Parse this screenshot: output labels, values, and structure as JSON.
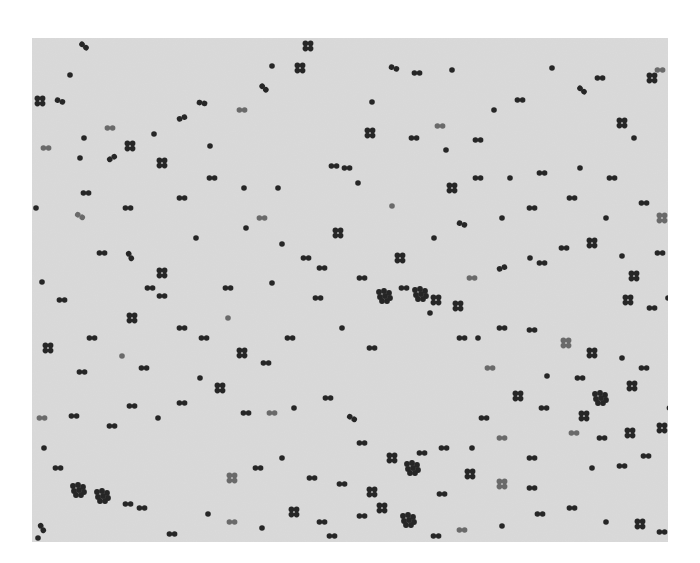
{
  "image": {
    "subject": "micrograph of spherical bacteria (cocci) in pairs, tetrads and small clusters",
    "frame": {
      "x": 32,
      "y": 38,
      "width": 636,
      "height": 504
    },
    "colors": {
      "page": "#ffffff",
      "field": "#dadada",
      "cell": "#262626",
      "cell_faint": "#6a6a6a"
    },
    "cells": [
      [
        52,
        8,
        "d",
        40
      ],
      [
        38,
        37,
        "s",
        0
      ],
      [
        8,
        63,
        "t",
        0
      ],
      [
        28,
        63,
        "d",
        20
      ],
      [
        78,
        90,
        "d",
        0
      ],
      [
        52,
        100,
        "s",
        0
      ],
      [
        54,
        155,
        "d",
        0
      ],
      [
        80,
        120,
        "d",
        -30
      ],
      [
        98,
        108,
        "t",
        0
      ],
      [
        122,
        96,
        "s",
        0
      ],
      [
        150,
        80,
        "d",
        -20
      ],
      [
        170,
        65,
        "d",
        10
      ],
      [
        178,
        108,
        "s",
        0
      ],
      [
        210,
        72,
        "d",
        0
      ],
      [
        232,
        50,
        "d",
        45
      ],
      [
        268,
        30,
        "t",
        0
      ],
      [
        276,
        8,
        "t",
        0
      ],
      [
        240,
        28,
        "s",
        0
      ],
      [
        130,
        125,
        "t",
        0
      ],
      [
        180,
        140,
        "d",
        0
      ],
      [
        212,
        150,
        "s",
        0
      ],
      [
        96,
        170,
        "d",
        0
      ],
      [
        48,
        178,
        "d",
        30
      ],
      [
        4,
        170,
        "s",
        0
      ],
      [
        150,
        160,
        "d",
        0
      ],
      [
        98,
        218,
        "d",
        60
      ],
      [
        130,
        235,
        "t",
        0
      ],
      [
        164,
        200,
        "s",
        0
      ],
      [
        118,
        250,
        "d",
        0
      ],
      [
        70,
        215,
        "d",
        0
      ],
      [
        214,
        190,
        "s",
        0
      ],
      [
        230,
        180,
        "d",
        0
      ],
      [
        246,
        150,
        "s",
        0
      ],
      [
        302,
        128,
        "d",
        0
      ],
      [
        315,
        130,
        "d",
        0
      ],
      [
        338,
        95,
        "t",
        0
      ],
      [
        340,
        64,
        "s",
        0
      ],
      [
        362,
        30,
        "d",
        20
      ],
      [
        385,
        35,
        "d",
        0
      ],
      [
        420,
        32,
        "s",
        0
      ],
      [
        408,
        88,
        "d",
        0
      ],
      [
        446,
        102,
        "d",
        0
      ],
      [
        462,
        72,
        "s",
        0
      ],
      [
        488,
        62,
        "d",
        0
      ],
      [
        520,
        30,
        "s",
        0
      ],
      [
        550,
        52,
        "d",
        40
      ],
      [
        568,
        40,
        "d",
        0
      ],
      [
        590,
        85,
        "t",
        0
      ],
      [
        620,
        40,
        "t",
        0
      ],
      [
        628,
        32,
        "d",
        0
      ],
      [
        602,
        100,
        "s",
        0
      ],
      [
        580,
        140,
        "d",
        0
      ],
      [
        548,
        130,
        "s",
        0
      ],
      [
        510,
        135,
        "d",
        0
      ],
      [
        478,
        140,
        "s",
        0
      ],
      [
        446,
        140,
        "d",
        0
      ],
      [
        414,
        112,
        "s",
        0
      ],
      [
        382,
        100,
        "d",
        0
      ],
      [
        360,
        168,
        "s",
        0
      ],
      [
        326,
        145,
        "s",
        0
      ],
      [
        420,
        150,
        "t",
        0
      ],
      [
        430,
        186,
        "d",
        20
      ],
      [
        402,
        200,
        "s",
        0
      ],
      [
        368,
        220,
        "t",
        0
      ],
      [
        388,
        256,
        "X",
        0
      ],
      [
        404,
        262,
        "t",
        0
      ],
      [
        426,
        268,
        "t",
        0
      ],
      [
        440,
        240,
        "d",
        0
      ],
      [
        470,
        230,
        "d",
        -20
      ],
      [
        498,
        220,
        "s",
        0
      ],
      [
        510,
        225,
        "d",
        0
      ],
      [
        532,
        210,
        "d",
        0
      ],
      [
        560,
        205,
        "t",
        0
      ],
      [
        590,
        218,
        "s",
        0
      ],
      [
        602,
        238,
        "t",
        0
      ],
      [
        628,
        215,
        "d",
        0
      ],
      [
        630,
        180,
        "t",
        0
      ],
      [
        612,
        165,
        "d",
        0
      ],
      [
        352,
        258,
        "X",
        0
      ],
      [
        372,
        250,
        "d",
        0
      ],
      [
        398,
        275,
        "s",
        0
      ],
      [
        430,
        300,
        "d",
        0
      ],
      [
        446,
        300,
        "s",
        0
      ],
      [
        470,
        290,
        "d",
        0
      ],
      [
        500,
        292,
        "d",
        0
      ],
      [
        534,
        305,
        "t",
        0
      ],
      [
        560,
        315,
        "t",
        0
      ],
      [
        590,
        320,
        "s",
        0
      ],
      [
        612,
        330,
        "d",
        0
      ],
      [
        600,
        348,
        "t",
        0
      ],
      [
        548,
        340,
        "d",
        0
      ],
      [
        515,
        338,
        "s",
        0
      ],
      [
        568,
        360,
        "X",
        0
      ],
      [
        552,
        378,
        "t",
        0
      ],
      [
        542,
        395,
        "d",
        0
      ],
      [
        570,
        400,
        "d",
        0
      ],
      [
        598,
        395,
        "t",
        0
      ],
      [
        630,
        390,
        "t",
        0
      ],
      [
        640,
        370,
        "d",
        0
      ],
      [
        614,
        418,
        "d",
        0
      ],
      [
        590,
        428,
        "d",
        0
      ],
      [
        560,
        430,
        "s",
        0
      ],
      [
        500,
        420,
        "d",
        0
      ],
      [
        470,
        400,
        "d",
        0
      ],
      [
        440,
        410,
        "s",
        0
      ],
      [
        412,
        410,
        "d",
        0
      ],
      [
        390,
        415,
        "d",
        0
      ],
      [
        360,
        420,
        "t",
        0
      ],
      [
        330,
        405,
        "d",
        0
      ],
      [
        320,
        380,
        "d",
        30
      ],
      [
        296,
        360,
        "d",
        0
      ],
      [
        262,
        370,
        "s",
        0
      ],
      [
        240,
        375,
        "d",
        0
      ],
      [
        214,
        375,
        "d",
        0
      ],
      [
        188,
        350,
        "t",
        0
      ],
      [
        168,
        340,
        "s",
        0
      ],
      [
        150,
        365,
        "d",
        0
      ],
      [
        126,
        380,
        "s",
        0
      ],
      [
        100,
        368,
        "d",
        0
      ],
      [
        80,
        388,
        "d",
        0
      ],
      [
        42,
        378,
        "d",
        0
      ],
      [
        10,
        380,
        "d",
        0
      ],
      [
        12,
        410,
        "s",
        0
      ],
      [
        26,
        430,
        "d",
        0
      ],
      [
        46,
        452,
        "X",
        0
      ],
      [
        70,
        458,
        "X",
        0
      ],
      [
        96,
        466,
        "d",
        0
      ],
      [
        110,
        470,
        "d",
        0
      ],
      [
        140,
        496,
        "d",
        0
      ],
      [
        176,
        476,
        "s",
        0
      ],
      [
        200,
        484,
        "d",
        0
      ],
      [
        230,
        490,
        "s",
        0
      ],
      [
        262,
        474,
        "t",
        0
      ],
      [
        290,
        484,
        "d",
        0
      ],
      [
        300,
        498,
        "d",
        0
      ],
      [
        330,
        478,
        "d",
        0
      ],
      [
        350,
        470,
        "t",
        0
      ],
      [
        376,
        482,
        "X",
        0
      ],
      [
        404,
        498,
        "d",
        0
      ],
      [
        430,
        492,
        "d",
        0
      ],
      [
        470,
        488,
        "s",
        0
      ],
      [
        508,
        476,
        "d",
        0
      ],
      [
        540,
        470,
        "d",
        0
      ],
      [
        574,
        484,
        "s",
        0
      ],
      [
        608,
        486,
        "t",
        0
      ],
      [
        630,
        494,
        "d",
        0
      ],
      [
        10,
        490,
        "d",
        60
      ],
      [
        6,
        500,
        "s",
        0
      ],
      [
        200,
        440,
        "t",
        0
      ],
      [
        226,
        430,
        "d",
        0
      ],
      [
        250,
        420,
        "s",
        0
      ],
      [
        280,
        440,
        "d",
        0
      ],
      [
        310,
        446,
        "d",
        0
      ],
      [
        340,
        454,
        "t",
        0
      ],
      [
        380,
        430,
        "X",
        0
      ],
      [
        410,
        456,
        "d",
        0
      ],
      [
        438,
        436,
        "t",
        0
      ],
      [
        470,
        446,
        "t",
        0
      ],
      [
        500,
        450,
        "d",
        0
      ],
      [
        10,
        244,
        "s",
        0
      ],
      [
        30,
        262,
        "d",
        0
      ],
      [
        60,
        300,
        "d",
        0
      ],
      [
        100,
        280,
        "t",
        0
      ],
      [
        130,
        258,
        "d",
        0
      ],
      [
        150,
        290,
        "d",
        0
      ],
      [
        172,
        300,
        "d",
        0
      ],
      [
        196,
        280,
        "s",
        0
      ],
      [
        210,
        315,
        "t",
        0
      ],
      [
        234,
        325,
        "d",
        0
      ],
      [
        258,
        300,
        "d",
        0
      ],
      [
        286,
        260,
        "d",
        0
      ],
      [
        310,
        290,
        "s",
        0
      ],
      [
        340,
        310,
        "d",
        0
      ],
      [
        16,
        310,
        "t",
        0
      ],
      [
        50,
        334,
        "d",
        0
      ],
      [
        90,
        318,
        "s",
        0
      ],
      [
        112,
        330,
        "d",
        0
      ],
      [
        196,
        250,
        "d",
        0
      ],
      [
        240,
        245,
        "s",
        0
      ],
      [
        274,
        220,
        "d",
        0
      ],
      [
        306,
        195,
        "t",
        0
      ],
      [
        330,
        240,
        "d",
        0
      ],
      [
        290,
        230,
        "d",
        0
      ],
      [
        250,
        206,
        "s",
        0
      ],
      [
        14,
        110,
        "d",
        0
      ],
      [
        48,
        120,
        "s",
        0
      ],
      [
        596,
        262,
        "t",
        0
      ],
      [
        620,
        270,
        "d",
        0
      ],
      [
        636,
        260,
        "s",
        0
      ],
      [
        470,
        180,
        "s",
        0
      ],
      [
        500,
        170,
        "d",
        0
      ],
      [
        540,
        160,
        "d",
        0
      ],
      [
        574,
        180,
        "s",
        0
      ],
      [
        458,
        330,
        "d",
        0
      ],
      [
        486,
        358,
        "t",
        0
      ],
      [
        512,
        370,
        "d",
        0
      ],
      [
        452,
        380,
        "d",
        0
      ]
    ]
  }
}
